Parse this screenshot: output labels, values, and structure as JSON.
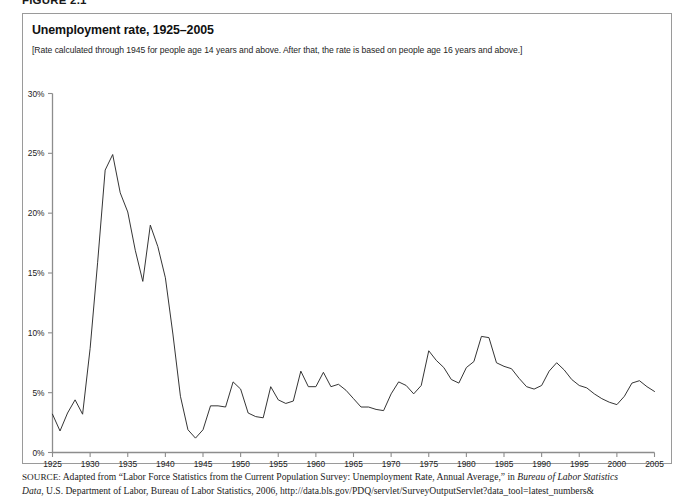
{
  "figure": {
    "label": "FIGURE 2.1"
  },
  "chart": {
    "title": "Unemployment rate, 1925–2005",
    "subtitle": "[Rate calculated through 1945 for people age 14 years and above. After that, the rate is based on people age 16 years and above.]"
  },
  "source": {
    "kicker": "SOURCE:",
    "line1_a": " Adapted from “Labor Force Statistics from the Current Population Survey: Unemployment Rate, Annual Average,” in ",
    "line1_italic": "Bureau of Labor Statistics",
    "line2_italic": "Data",
    "line2_b": ", U.S. Department of Labor, Bureau of Labor Statistics, 2006, http://data.bls.gov/PDQ/servlet/SurveyOutputServlet?data_tool=latest_numbers&"
  },
  "colors": {
    "line": "#2a2a2a",
    "axis": "#8d8d8d",
    "border": "#9a9a9a",
    "background": "#ffffff",
    "text": "#111111"
  },
  "chart_data": {
    "type": "line",
    "title": "Unemployment rate, 1925–2005",
    "subtitle": "[Rate calculated through 1945 for people age 14 years and above. After that, the rate is based on people age 16 years and above.]",
    "xlabel": "",
    "ylabel": "",
    "xlim": [
      1925,
      2005
    ],
    "ylim": [
      0,
      30
    ],
    "grid": false,
    "legend": false,
    "y_tick_values": [
      0,
      5,
      10,
      15,
      20,
      25,
      30
    ],
    "y_tick_labels": [
      "0%",
      "5%",
      "10%",
      "15%",
      "20%",
      "25%",
      "30%"
    ],
    "x_tick_values": [
      1925,
      1930,
      1935,
      1940,
      1945,
      1950,
      1955,
      1960,
      1965,
      1970,
      1975,
      1980,
      1985,
      1990,
      1995,
      2000,
      2005
    ],
    "x_tick_labels": [
      "1925",
      "1930",
      "1935",
      "1940",
      "1945",
      "1950",
      "1955",
      "1960",
      "1965",
      "1970",
      "1975",
      "1980",
      "1985",
      "1990",
      "1995",
      "2000",
      "2005"
    ],
    "series": [
      {
        "name": "Unemployment rate",
        "units": "percent",
        "x": [
          1925,
          1926,
          1927,
          1928,
          1929,
          1930,
          1931,
          1932,
          1933,
          1934,
          1935,
          1936,
          1937,
          1938,
          1939,
          1940,
          1941,
          1942,
          1943,
          1944,
          1945,
          1946,
          1947,
          1948,
          1949,
          1950,
          1951,
          1952,
          1953,
          1954,
          1955,
          1956,
          1957,
          1958,
          1959,
          1960,
          1961,
          1962,
          1963,
          1964,
          1965,
          1966,
          1967,
          1968,
          1969,
          1970,
          1971,
          1972,
          1973,
          1974,
          1975,
          1976,
          1977,
          1978,
          1979,
          1980,
          1981,
          1982,
          1983,
          1984,
          1985,
          1986,
          1987,
          1988,
          1989,
          1990,
          1991,
          1992,
          1993,
          1994,
          1995,
          1996,
          1997,
          1998,
          1999,
          2000,
          2001,
          2002,
          2003,
          2004,
          2005
        ],
        "values": [
          3.2,
          1.8,
          3.3,
          4.4,
          3.2,
          8.7,
          15.9,
          23.6,
          24.9,
          21.7,
          20.1,
          16.9,
          14.3,
          19.0,
          17.2,
          14.6,
          9.9,
          4.7,
          1.9,
          1.2,
          1.9,
          3.9,
          3.9,
          3.8,
          5.9,
          5.3,
          3.3,
          3.0,
          2.9,
          5.5,
          4.4,
          4.1,
          4.3,
          6.8,
          5.5,
          5.5,
          6.7,
          5.5,
          5.7,
          5.2,
          4.5,
          3.8,
          3.8,
          3.6,
          3.5,
          4.9,
          5.9,
          5.6,
          4.9,
          5.6,
          8.5,
          7.7,
          7.1,
          6.1,
          5.8,
          7.1,
          7.6,
          9.7,
          9.6,
          7.5,
          7.2,
          7.0,
          6.2,
          5.5,
          5.3,
          5.6,
          6.8,
          7.5,
          6.9,
          6.1,
          5.6,
          5.4,
          4.9,
          4.5,
          4.2,
          4.0,
          4.7,
          5.8,
          6.0,
          5.5,
          5.1
        ]
      }
    ]
  }
}
